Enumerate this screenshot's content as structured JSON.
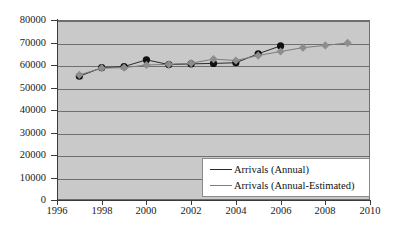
{
  "chart_data": {
    "type": "line",
    "title": "",
    "xlabel": "",
    "ylabel": "",
    "xlim": [
      1996,
      2010
    ],
    "ylim": [
      0,
      80000
    ],
    "grid": true,
    "legend_position": "lower-right",
    "x_ticks": [
      1996,
      1998,
      2000,
      2002,
      2004,
      2006,
      2008,
      2010
    ],
    "x_tick_labels": [
      "1996",
      "1998",
      "2000",
      "2002",
      "2004",
      "2006",
      "2008",
      "2010"
    ],
    "y_ticks": [
      0,
      10000,
      20000,
      30000,
      40000,
      50000,
      60000,
      70000,
      80000
    ],
    "y_tick_labels": [
      "0",
      "10000",
      "20000",
      "30000",
      "40000",
      "50000",
      "60000",
      "70000",
      "80000"
    ],
    "series": [
      {
        "name": "Arrivals (Annual)",
        "marker": "circle",
        "color": "#111111",
        "line_color": "#2b2b2b",
        "x": [
          1997,
          1998,
          1999,
          2000,
          2001,
          2002,
          2003,
          2004,
          2005,
          2006
        ],
        "values": [
          55000,
          58800,
          59300,
          62300,
          60200,
          60500,
          60700,
          61000,
          65000,
          68500
        ]
      },
      {
        "name": "Arrivals (Annual-Estimated)",
        "marker": "diamond",
        "color": "#8d8d8d",
        "line_color": "#7d7d7d",
        "x": [
          1997,
          1998,
          1999,
          2000,
          2001,
          2002,
          2003,
          2004,
          2005,
          2006,
          2007,
          2008,
          2009
        ],
        "values": [
          55600,
          58600,
          58800,
          60000,
          60300,
          60800,
          62600,
          62000,
          64200,
          66000,
          67700,
          68700,
          69800
        ]
      }
    ]
  },
  "legend": {
    "items": [
      {
        "label": "Arrivals (Annual)",
        "marker": "circle-marker"
      },
      {
        "label": "Arrivals (Annual-Estimated)",
        "marker": "diamond-marker"
      }
    ]
  },
  "colors": {
    "plot_background": "#c9c9c9",
    "gridline": "#6f6f6f",
    "axis": "#3a3a3a",
    "series_annual": "#111111",
    "series_estimated": "#8d8d8d",
    "page_background": "#ffffff"
  }
}
